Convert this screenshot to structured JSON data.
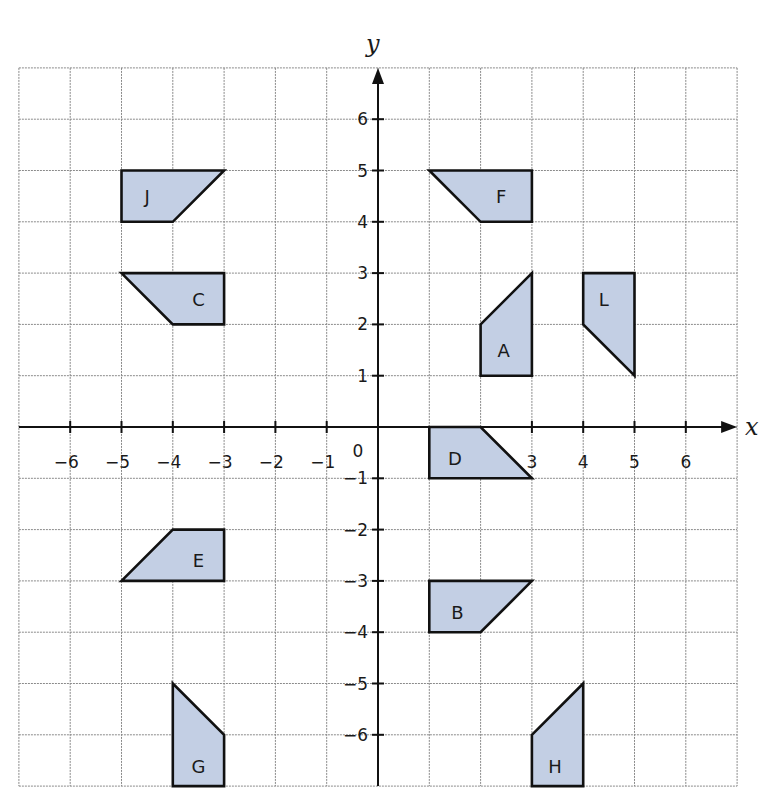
{
  "chart_data": {
    "type": "coordinate-grid",
    "title": "",
    "xlabel": "x",
    "ylabel": "y",
    "xlim": [
      -7,
      7
    ],
    "ylim": [
      -7,
      7
    ],
    "grid": true,
    "x_ticks": [
      -6,
      -5,
      -4,
      -3,
      -2,
      -1,
      3,
      4,
      5,
      6
    ],
    "y_ticks": [
      6,
      5,
      4,
      3,
      2,
      1,
      -1,
      -2,
      -3,
      -4,
      -5,
      -6
    ],
    "origin_label": "0",
    "shapes": [
      {
        "label": "J",
        "vertices": [
          [
            -5,
            5
          ],
          [
            -3,
            5
          ],
          [
            -4,
            4
          ],
          [
            -5,
            4
          ]
        ],
        "label_pos": [
          -4.5,
          4.5
        ]
      },
      {
        "label": "C",
        "vertices": [
          [
            -5,
            3
          ],
          [
            -3,
            3
          ],
          [
            -3,
            2
          ],
          [
            -4,
            2
          ]
        ],
        "label_pos": [
          -3.5,
          2.5
        ]
      },
      {
        "label": "F",
        "vertices": [
          [
            1,
            5
          ],
          [
            3,
            5
          ],
          [
            3,
            4
          ],
          [
            2,
            4
          ]
        ],
        "label_pos": [
          2.4,
          4.5
        ]
      },
      {
        "label": "A",
        "vertices": [
          [
            2,
            2
          ],
          [
            3,
            3
          ],
          [
            3,
            1
          ],
          [
            2,
            1
          ]
        ],
        "label_pos": [
          2.45,
          1.5
        ]
      },
      {
        "label": "L",
        "vertices": [
          [
            4,
            3
          ],
          [
            5,
            3
          ],
          [
            5,
            1
          ],
          [
            4,
            2
          ]
        ],
        "label_pos": [
          4.4,
          2.5
        ]
      },
      {
        "label": "D",
        "vertices": [
          [
            1,
            0
          ],
          [
            2,
            0
          ],
          [
            3,
            -1
          ],
          [
            1,
            -1
          ]
        ],
        "label_pos": [
          1.5,
          -0.6
        ]
      },
      {
        "label": "E",
        "vertices": [
          [
            -4,
            -2
          ],
          [
            -3,
            -2
          ],
          [
            -3,
            -3
          ],
          [
            -5,
            -3
          ]
        ],
        "label_pos": [
          -3.5,
          -2.6
        ]
      },
      {
        "label": "B",
        "vertices": [
          [
            1,
            -3
          ],
          [
            3,
            -3
          ],
          [
            2,
            -4
          ],
          [
            1,
            -4
          ]
        ],
        "label_pos": [
          1.55,
          -3.6
        ]
      },
      {
        "label": "G",
        "vertices": [
          [
            -4,
            -5
          ],
          [
            -3,
            -6
          ],
          [
            -3,
            -7
          ],
          [
            -4,
            -7
          ]
        ],
        "label_pos": [
          -3.5,
          -6.6
        ]
      },
      {
        "label": "H",
        "vertices": [
          [
            3,
            -6
          ],
          [
            4,
            -5
          ],
          [
            4,
            -7
          ],
          [
            3,
            -7
          ]
        ],
        "label_pos": [
          3.45,
          -6.6
        ]
      }
    ]
  },
  "colors": {
    "shape_fill": "#c3cfe4",
    "shape_stroke": "#111111",
    "grid": "#8a8a8a",
    "axis": "#111111"
  }
}
